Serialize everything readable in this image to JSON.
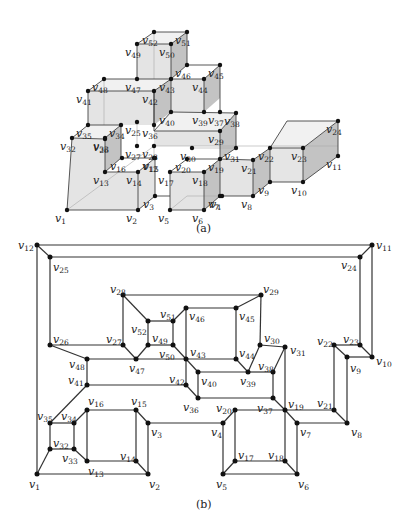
{
  "figure": {
    "panel_a": {
      "caption": "(a)",
      "description": "3D polycube of unit cubes drawn in oblique projection with labeled vertices v1..v52",
      "vertices": [
        {
          "id": "v1",
          "x": 67,
          "y": 210
        },
        {
          "id": "v2",
          "x": 138,
          "y": 210
        },
        {
          "id": "v3",
          "x": 155,
          "y": 196
        },
        {
          "id": "v4",
          "x": 222,
          "y": 196
        },
        {
          "id": "v5",
          "x": 170,
          "y": 210
        },
        {
          "id": "v6",
          "x": 204,
          "y": 210
        },
        {
          "id": "v7",
          "x": 220,
          "y": 196
        },
        {
          "id": "v8",
          "x": 253,
          "y": 196
        },
        {
          "id": "v9",
          "x": 270,
          "y": 182
        },
        {
          "id": "v10",
          "x": 303,
          "y": 182
        },
        {
          "id": "v11",
          "x": 338,
          "y": 156
        },
        {
          "id": "v12",
          "x": 154,
          "y": 158
        },
        {
          "id": "v13",
          "x": 105,
          "y": 172
        },
        {
          "id": "v14",
          "x": 138,
          "y": 172
        },
        {
          "id": "v15",
          "x": 155,
          "y": 158
        },
        {
          "id": "v16",
          "x": 122,
          "y": 158
        },
        {
          "id": "v17",
          "x": 170,
          "y": 172
        },
        {
          "id": "v18",
          "x": 204,
          "y": 172
        },
        {
          "id": "v19",
          "x": 220,
          "y": 159
        },
        {
          "id": "v20",
          "x": 187,
          "y": 159
        },
        {
          "id": "v21",
          "x": 253,
          "y": 160
        },
        {
          "id": "v22",
          "x": 270,
          "y": 148
        },
        {
          "id": "v23",
          "x": 303,
          "y": 148
        },
        {
          "id": "v24",
          "x": 338,
          "y": 121
        },
        {
          "id": "v25",
          "x": 137,
          "y": 122
        },
        {
          "id": "v26",
          "x": 105,
          "y": 139
        },
        {
          "id": "v27",
          "x": 137,
          "y": 146
        },
        {
          "id": "v28",
          "x": 154,
          "y": 146
        },
        {
          "id": "v29",
          "x": 220,
          "y": 131
        },
        {
          "id": "v30",
          "x": 192,
          "y": 148
        },
        {
          "id": "v31",
          "x": 236,
          "y": 148
        },
        {
          "id": "v32",
          "x": 72,
          "y": 138
        },
        {
          "id": "v33",
          "x": 105,
          "y": 138
        },
        {
          "id": "v34",
          "x": 121,
          "y": 125
        },
        {
          "id": "v35",
          "x": 88,
          "y": 125
        },
        {
          "id": "v36",
          "x": 154,
          "y": 125
        },
        {
          "id": "v37",
          "x": 220,
          "y": 112
        },
        {
          "id": "v38",
          "x": 236,
          "y": 113
        },
        {
          "id": "v39",
          "x": 204,
          "y": 112
        },
        {
          "id": "v40",
          "x": 171,
          "y": 112
        },
        {
          "id": "v41",
          "x": 88,
          "y": 91
        },
        {
          "id": "v42",
          "x": 154,
          "y": 91
        },
        {
          "id": "v43",
          "x": 171,
          "y": 79
        },
        {
          "id": "v44",
          "x": 204,
          "y": 79
        },
        {
          "id": "v45",
          "x": 220,
          "y": 65
        },
        {
          "id": "v46",
          "x": 187,
          "y": 65
        },
        {
          "id": "v47",
          "x": 137,
          "y": 79
        },
        {
          "id": "v48",
          "x": 104,
          "y": 79
        },
        {
          "id": "v49",
          "x": 137,
          "y": 44
        },
        {
          "id": "v50",
          "x": 171,
          "y": 44
        },
        {
          "id": "v51",
          "x": 187,
          "y": 32
        },
        {
          "id": "v52",
          "x": 154,
          "y": 32
        }
      ]
    },
    "panel_b": {
      "caption": "(b)",
      "description": "Planar drawing (Schlegel-like) of the graph of the polycube in (a)",
      "vertices": [
        {
          "id": "v1",
          "x": 37,
          "y": 474,
          "lx": 29,
          "ly": 488
        },
        {
          "id": "v2",
          "x": 148,
          "y": 474,
          "lx": 149,
          "ly": 488
        },
        {
          "id": "v3",
          "x": 148,
          "y": 423,
          "lx": 151,
          "ly": 436
        },
        {
          "id": "v4",
          "x": 223,
          "y": 423,
          "lx": 211,
          "ly": 436
        },
        {
          "id": "v5",
          "x": 223,
          "y": 474,
          "lx": 216,
          "ly": 488
        },
        {
          "id": "v6",
          "x": 297,
          "y": 474,
          "lx": 298,
          "ly": 488
        },
        {
          "id": "v7",
          "x": 297,
          "y": 423,
          "lx": 300,
          "ly": 436
        },
        {
          "id": "v8",
          "x": 347,
          "y": 423,
          "lx": 351,
          "ly": 436
        },
        {
          "id": "v9",
          "x": 347,
          "y": 357,
          "lx": 350,
          "ly": 372
        },
        {
          "id": "v10",
          "x": 372,
          "y": 357,
          "lx": 376,
          "ly": 365
        },
        {
          "id": "v11",
          "x": 372,
          "y": 245,
          "lx": 376,
          "ly": 249
        },
        {
          "id": "v12",
          "x": 37,
          "y": 245,
          "lx": 18,
          "ly": 249
        },
        {
          "id": "v13",
          "x": 87,
          "y": 461,
          "lx": 88,
          "ly": 475
        },
        {
          "id": "v14",
          "x": 136,
          "y": 461,
          "lx": 120,
          "ly": 460
        },
        {
          "id": "v15",
          "x": 136,
          "y": 410,
          "lx": 131,
          "ly": 405
        },
        {
          "id": "v16",
          "x": 87,
          "y": 410,
          "lx": 88,
          "ly": 405
        },
        {
          "id": "v17",
          "x": 235,
          "y": 461,
          "lx": 238,
          "ly": 459
        },
        {
          "id": "v18",
          "x": 285,
          "y": 461,
          "lx": 268,
          "ly": 459
        },
        {
          "id": "v19",
          "x": 285,
          "y": 410,
          "lx": 288,
          "ly": 408
        },
        {
          "id": "v20",
          "x": 235,
          "y": 410,
          "lx": 216,
          "ly": 412
        },
        {
          "id": "v21",
          "x": 334,
          "y": 410,
          "lx": 317,
          "ly": 407
        },
        {
          "id": "v22",
          "x": 334,
          "y": 345,
          "lx": 317,
          "ly": 345
        },
        {
          "id": "v23",
          "x": 360,
          "y": 345,
          "lx": 343,
          "ly": 343
        },
        {
          "id": "v24",
          "x": 360,
          "y": 257,
          "lx": 341,
          "ly": 269
        },
        {
          "id": "v25",
          "x": 50,
          "y": 257,
          "lx": 53,
          "ly": 271
        },
        {
          "id": "v26",
          "x": 50,
          "y": 345,
          "lx": 53,
          "ly": 343
        },
        {
          "id": "v27",
          "x": 123,
          "y": 345,
          "lx": 106,
          "ly": 343
        },
        {
          "id": "v28",
          "x": 123,
          "y": 295,
          "lx": 110,
          "ly": 293
        },
        {
          "id": "v29",
          "x": 261,
          "y": 295,
          "lx": 263,
          "ly": 293
        },
        {
          "id": "v30",
          "x": 260,
          "y": 345,
          "lx": 264,
          "ly": 342
        },
        {
          "id": "v31",
          "x": 285,
          "y": 347,
          "lx": 290,
          "ly": 354
        },
        {
          "id": "v32",
          "x": 50,
          "y": 449,
          "lx": 53,
          "ly": 447
        },
        {
          "id": "v33",
          "x": 74,
          "y": 449,
          "lx": 62,
          "ly": 462
        },
        {
          "id": "v34",
          "x": 74,
          "y": 423,
          "lx": 61,
          "ly": 420
        },
        {
          "id": "v35",
          "x": 50,
          "y": 423,
          "lx": 37,
          "ly": 420
        },
        {
          "id": "v36",
          "x": 198,
          "y": 398,
          "lx": 183,
          "ly": 411
        },
        {
          "id": "v37",
          "x": 273,
          "y": 398,
          "lx": 257,
          "ly": 412
        },
        {
          "id": "v38",
          "x": 273,
          "y": 372,
          "lx": 258,
          "ly": 370
        },
        {
          "id": "v39",
          "x": 248,
          "y": 372,
          "lx": 240,
          "ly": 385
        },
        {
          "id": "v40",
          "x": 198,
          "y": 372,
          "lx": 201,
          "ly": 385
        },
        {
          "id": "v41",
          "x": 87,
          "y": 385,
          "lx": 68,
          "ly": 384
        },
        {
          "id": "v42",
          "x": 186,
          "y": 385,
          "lx": 169,
          "ly": 383
        },
        {
          "id": "v43",
          "x": 186,
          "y": 359,
          "lx": 190,
          "ly": 356
        },
        {
          "id": "v44",
          "x": 236,
          "y": 359,
          "lx": 239,
          "ly": 357
        },
        {
          "id": "v45",
          "x": 236,
          "y": 308,
          "lx": 239,
          "ly": 320
        },
        {
          "id": "v46",
          "x": 186,
          "y": 308,
          "lx": 189,
          "ly": 320
        },
        {
          "id": "v47",
          "x": 136,
          "y": 359,
          "lx": 129,
          "ly": 372
        },
        {
          "id": "v48",
          "x": 87,
          "y": 359,
          "lx": 69,
          "ly": 368
        },
        {
          "id": "v49",
          "x": 148,
          "y": 345,
          "lx": 152,
          "ly": 342
        },
        {
          "id": "v50",
          "x": 173,
          "y": 345,
          "lx": 159,
          "ly": 358
        },
        {
          "id": "v51",
          "x": 173,
          "y": 321,
          "lx": 160,
          "ly": 318
        },
        {
          "id": "v52",
          "x": 148,
          "y": 321,
          "lx": 131,
          "ly": 333
        }
      ],
      "edges": [
        [
          "v12",
          "v11"
        ],
        [
          "v12",
          "v25"
        ],
        [
          "v11",
          "v24"
        ],
        [
          "v25",
          "v24"
        ],
        [
          "v12",
          "v1"
        ],
        [
          "v11",
          "v10"
        ],
        [
          "v25",
          "v26"
        ],
        [
          "v24",
          "v23"
        ],
        [
          "v23",
          "v10"
        ],
        [
          "v23",
          "v22"
        ],
        [
          "v22",
          "v9"
        ],
        [
          "v9",
          "v10"
        ],
        [
          "v22",
          "v21"
        ],
        [
          "v9",
          "v8"
        ],
        [
          "v21",
          "v8"
        ],
        [
          "v21",
          "v19"
        ],
        [
          "v8",
          "v7"
        ],
        [
          "v28",
          "v29"
        ],
        [
          "v28",
          "v52"
        ],
        [
          "v28",
          "v27"
        ],
        [
          "v29",
          "v45"
        ],
        [
          "v29",
          "v30"
        ],
        [
          "v52",
          "v51"
        ],
        [
          "v52",
          "v49"
        ],
        [
          "v51",
          "v46"
        ],
        [
          "v51",
          "v50"
        ],
        [
          "v49",
          "v50"
        ],
        [
          "v49",
          "v47"
        ],
        [
          "v27",
          "v47"
        ],
        [
          "v46",
          "v45"
        ],
        [
          "v46",
          "v43"
        ],
        [
          "v45",
          "v44"
        ],
        [
          "v50",
          "v43"
        ],
        [
          "v43",
          "v44"
        ],
        [
          "v43",
          "v40"
        ],
        [
          "v43",
          "v42"
        ],
        [
          "v44",
          "v39"
        ],
        [
          "v30",
          "v39"
        ],
        [
          "v30",
          "v31"
        ],
        [
          "v31",
          "v38"
        ],
        [
          "v31",
          "v19"
        ],
        [
          "v39",
          "v38"
        ],
        [
          "v39",
          "v40"
        ],
        [
          "v38",
          "v37"
        ],
        [
          "v40",
          "v36"
        ],
        [
          "v42",
          "v36"
        ],
        [
          "v36",
          "v37"
        ],
        [
          "v37",
          "v19"
        ],
        [
          "v26",
          "v27"
        ],
        [
          "v26",
          "v48"
        ],
        [
          "v48",
          "v43"
        ],
        [
          "v48",
          "v41"
        ],
        [
          "v41",
          "v42"
        ],
        [
          "v41",
          "v35"
        ],
        [
          "v35",
          "v34"
        ],
        [
          "v35",
          "v32"
        ],
        [
          "v34",
          "v33"
        ],
        [
          "v34",
          "v16"
        ],
        [
          "v32",
          "v33"
        ],
        [
          "v32",
          "v1"
        ],
        [
          "v33",
          "v13"
        ],
        [
          "v16",
          "v15"
        ],
        [
          "v16",
          "v13"
        ],
        [
          "v15",
          "v14"
        ],
        [
          "v15",
          "v3"
        ],
        [
          "v13",
          "v14"
        ],
        [
          "v14",
          "v2"
        ],
        [
          "v1",
          "v2"
        ],
        [
          "v2",
          "v3"
        ],
        [
          "v3",
          "v4"
        ],
        [
          "v4",
          "v20"
        ],
        [
          "v4",
          "v5"
        ],
        [
          "v20",
          "v19"
        ],
        [
          "v20",
          "v17"
        ],
        [
          "v19",
          "v18"
        ],
        [
          "v19",
          "v7"
        ],
        [
          "v17",
          "v18"
        ],
        [
          "v17",
          "v5"
        ],
        [
          "v18",
          "v6"
        ],
        [
          "v5",
          "v6"
        ],
        [
          "v6",
          "v7"
        ]
      ]
    }
  }
}
